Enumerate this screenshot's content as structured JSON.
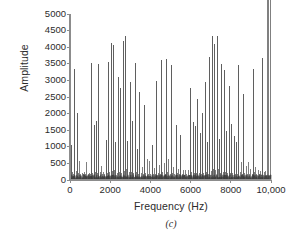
{
  "figure": {
    "caption": "(c)",
    "axis_color": "#8c8c8c",
    "line_color": "#3a3a3a"
  },
  "chart_data": {
    "type": "line",
    "title": "",
    "subtitle": "",
    "xlabel": "Frequency (Hz)",
    "ylabel": "Amplitude",
    "xlim": [
      0,
      10000
    ],
    "ylim": [
      0,
      5000
    ],
    "grid": false,
    "legend": null,
    "annotations": [
      "(c)"
    ],
    "xticks": [
      0,
      2000,
      4000,
      6000,
      8000,
      10000
    ],
    "xtick_labels": [
      "0",
      "2000",
      "4000",
      "6000",
      "8000",
      "10,000"
    ],
    "yticks": [
      0,
      500,
      1000,
      1500,
      2000,
      2500,
      3000,
      3500,
      4000,
      4500,
      5000
    ],
    "ytick_labels": [
      "0",
      "500",
      "1000",
      "1500",
      "2000",
      "2500",
      "3000",
      "3500",
      "4000",
      "4500",
      "5000"
    ],
    "noise_floor": 120,
    "x": [
      60,
      120,
      180,
      240,
      300,
      360,
      420,
      480,
      540,
      600,
      660,
      720,
      780,
      840,
      900,
      960,
      1020,
      1080,
      1140,
      1200,
      1260,
      1320,
      1380,
      1440,
      1500,
      1560,
      1620,
      1680,
      1740,
      1800,
      1860,
      1920,
      1980,
      2040,
      2100,
      2160,
      2220,
      2280,
      2340,
      2400,
      2460,
      2520,
      2580,
      2640,
      2700,
      2760,
      2820,
      2880,
      2940,
      3000,
      3060,
      3120,
      3180,
      3240,
      3300,
      3360,
      3420,
      3480,
      3540,
      3600,
      3660,
      3720,
      3780,
      3840,
      3900,
      3960,
      4020,
      4080,
      4140,
      4200,
      4260,
      4320,
      4380,
      4440,
      4500,
      4560,
      4620,
      4680,
      4740,
      4800,
      4860,
      4920,
      4980,
      5040,
      5100,
      5160,
      5220,
      5280,
      5340,
      5400,
      5460,
      5520,
      5580,
      5640,
      5700,
      5760,
      5820,
      5880,
      5940,
      6000,
      6060,
      6120,
      6180,
      6240,
      6300,
      6360,
      6420,
      6480,
      6540,
      6600,
      6660,
      6720,
      6780,
      6840,
      6900,
      6960,
      7020,
      7080,
      7140,
      7200,
      7260,
      7320,
      7380,
      7440,
      7500,
      7560,
      7620,
      7680,
      7740,
      7800,
      7860,
      7920,
      7980,
      8040,
      8100,
      8160,
      8220,
      8280,
      8340,
      8400,
      8460,
      8520,
      8580,
      8640,
      8700,
      8760,
      8820,
      8880,
      8940,
      9000,
      9060,
      9120,
      9180,
      9240,
      9300,
      9360,
      9420,
      9480,
      9540,
      9600,
      9660,
      9720,
      9780,
      9840,
      9900,
      9960
    ],
    "y": [
      1050,
      230,
      180,
      3330,
      260,
      2030,
      200,
      560,
      170,
      220,
      190,
      250,
      180,
      540,
      170,
      200,
      190,
      3520,
      210,
      1660,
      230,
      1780,
      200,
      3490,
      250,
      420,
      170,
      230,
      190,
      1200,
      200,
      3560,
      240,
      4140,
      260,
      4070,
      300,
      1150,
      210,
      3090,
      240,
      2760,
      220,
      4200,
      280,
      4350,
      320,
      1170,
      230,
      2960,
      250,
      1780,
      210,
      3520,
      230,
      940,
      180,
      2660,
      210,
      380,
      170,
      2250,
      200,
      620,
      180,
      560,
      170,
      1060,
      190,
      350,
      170,
      2980,
      220,
      450,
      180,
      3620,
      240,
      500,
      180,
      3640,
      230,
      640,
      190,
      3470,
      220,
      380,
      170,
      1660,
      200,
      340,
      170,
      1350,
      190,
      290,
      160,
      300,
      170,
      290,
      160,
      2780,
      230,
      1750,
      210,
      1640,
      200,
      2430,
      220,
      1410,
      190,
      2030,
      210,
      2950,
      240,
      1140,
      190,
      3720,
      260,
      4350,
      330,
      4090,
      290,
      4350,
      320,
      1240,
      220,
      3500,
      250,
      3300,
      230,
      1480,
      200,
      2840,
      220,
      1680,
      200,
      1340,
      190,
      1140,
      180,
      3460,
      230,
      530,
      180,
      2600,
      210,
      430,
      170,
      550,
      180,
      340,
      170,
      3350,
      230,
      400,
      170,
      310,
      170,
      280,
      160,
      3660,
      250,
      280,
      160
    ]
  },
  "axes": {
    "plot_left_px": 70,
    "plot_right_px": 271,
    "plot_top_px": 14,
    "plot_bottom_px": 180
  }
}
